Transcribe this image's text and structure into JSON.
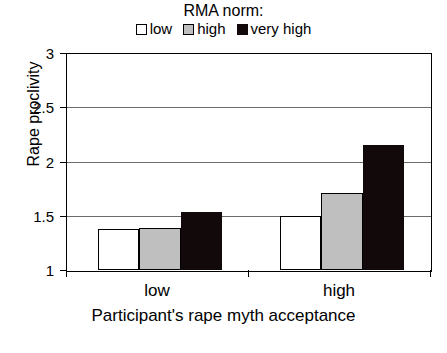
{
  "legend": {
    "title": "RMA norm:",
    "items": [
      {
        "label": "low",
        "color": "#ffffff",
        "swatch": "legend-swatch-low"
      },
      {
        "label": "high",
        "color": "#bfbfbf",
        "swatch": "legend-swatch-high"
      },
      {
        "label": "very high",
        "color": "#120a0a",
        "swatch": "legend-swatch-very-high"
      }
    ]
  },
  "axes": {
    "y": {
      "title": "Rape proclivity",
      "ticks": [
        "1",
        "1.5",
        "2",
        "2.5",
        "3"
      ],
      "min": 1,
      "max": 3
    },
    "x": {
      "title": "Participant's rape myth acceptance",
      "ticks": [
        "low",
        "high"
      ]
    }
  },
  "chart_data": {
    "type": "bar",
    "title": "",
    "subtitle": "",
    "xlabel": "Participant's rape myth acceptance",
    "ylabel": "Rape proclivity",
    "categories": [
      "low",
      "high"
    ],
    "series": [
      {
        "name": "low",
        "color": "#ffffff",
        "values": [
          1.38,
          1.5
        ]
      },
      {
        "name": "high",
        "color": "#bfbfbf",
        "values": [
          1.39,
          1.71
        ]
      },
      {
        "name": "very high",
        "color": "#120a0a",
        "values": [
          1.53,
          2.15
        ]
      }
    ],
    "legend_title": "RMA norm:",
    "legend_position": "top",
    "ylim": [
      1,
      3
    ],
    "yticks": [
      1,
      1.5,
      2,
      2.5,
      3
    ],
    "grid": true,
    "grid_axis": "y"
  }
}
